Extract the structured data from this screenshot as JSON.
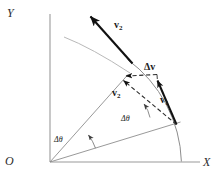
{
  "figure": {
    "kind": "physics-vector-diagram",
    "width": 218,
    "height": 177,
    "background": "#ffffff",
    "ink": "#1a1a1a",
    "thin_line": "#8a8a8a",
    "axes": {
      "y_label": "Y",
      "x_label": "X",
      "origin_label": "O"
    },
    "labels": {
      "v2_outer": "v",
      "v2_outer_sub": "2",
      "v2_inner": "v",
      "v2_inner_sub": "2",
      "v1": "v",
      "v1_sub": "1",
      "delta_v": "Δv",
      "delta_theta_inner": "Δθ",
      "delta_theta_outer": "Δθ"
    },
    "geometry": {
      "origin": [
        50,
        162
      ],
      "y_axis_top": [
        50,
        14
      ],
      "x_axis_right": [
        200,
        162
      ],
      "radius": 132,
      "arc_start_point": [
        181,
        160
      ],
      "arc_end_point": [
        128,
        60
      ],
      "radial_line_1_end": [
        180,
        122
      ],
      "radial_line_2_end": [
        128,
        75
      ],
      "v1_tail": [
        176,
        124
      ],
      "v1_head": [
        156,
        78
      ],
      "v2_tail": [
        176,
        124
      ],
      "v2_head": [
        121,
        79
      ],
      "delta_v_tail": [
        156,
        75
      ],
      "delta_v_head": [
        124,
        77
      ],
      "big_v2_tail": [
        132,
        62
      ],
      "big_v2_head": [
        88,
        13
      ],
      "trajectory_arc_present": true
    }
  }
}
